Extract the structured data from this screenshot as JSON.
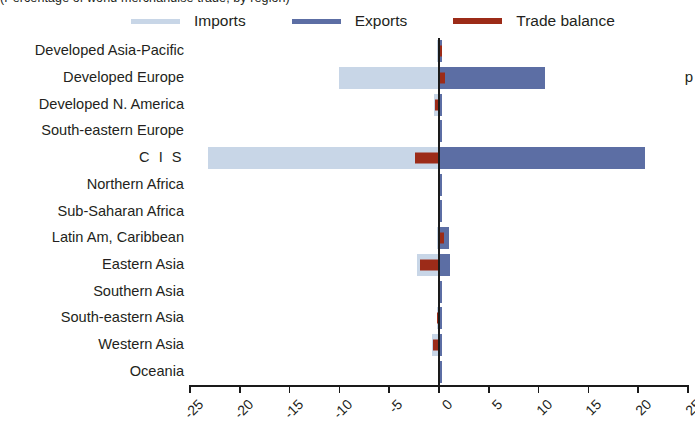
{
  "title_fragment": "(Percentage of world merchandise trade, by region)",
  "right_text_fragment": "p",
  "legend": {
    "items": [
      {
        "label": "Imports",
        "color": "#c8d6e7",
        "icon": "legend-line-imports"
      },
      {
        "label": "Exports",
        "color": "#5c6ea4",
        "icon": "legend-line-exports"
      },
      {
        "label": "Trade balance",
        "color": "#9c2b18",
        "icon": "legend-line-trade-balance"
      }
    ]
  },
  "chart_data": {
    "type": "bar",
    "orientation": "horizontal",
    "title": "",
    "xlabel": "",
    "ylabel": "",
    "xlim": [
      -25,
      25
    ],
    "xticks": [
      -25,
      -20,
      -15,
      -10,
      -5,
      0,
      5,
      10,
      15,
      20,
      25
    ],
    "xtick_labels": [
      "-25",
      "-20",
      "-15",
      "-10",
      "-5",
      "0",
      "5",
      "10",
      "15",
      "20",
      "25"
    ],
    "grid": false,
    "legend_position": "top",
    "categories": [
      "Developed Asia-Pacific",
      "Developed Europe",
      "Developed N. America",
      "South-eastern Europe",
      "C I S",
      "Northern Africa",
      "Sub-Saharan Africa",
      "Latin Am, Caribbean",
      "Eastern Asia",
      "Southern Asia",
      "South-eastern Asia",
      "Western Asia",
      "Oceania"
    ],
    "series": [
      {
        "name": "Imports",
        "color": "#c8d6e7",
        "values": [
          -0.2,
          -10.0,
          -0.5,
          -0.1,
          -23.2,
          -0.1,
          -0.1,
          -0.2,
          -2.2,
          -0.1,
          -0.2,
          -0.7,
          -0.05
        ]
      },
      {
        "name": "Exports",
        "color": "#5c6ea4",
        "values": [
          0.3,
          10.6,
          0.3,
          0.3,
          20.7,
          0.1,
          0.1,
          1.0,
          1.1,
          0.1,
          0.3,
          0.2,
          0.05
        ]
      },
      {
        "name": "Trade balance",
        "color": "#9c2b18",
        "values": [
          0.2,
          0.6,
          -0.4,
          0.0,
          -2.4,
          0.0,
          0.0,
          0.5,
          -1.9,
          0.0,
          -0.2,
          -0.6,
          0.0
        ]
      }
    ]
  }
}
